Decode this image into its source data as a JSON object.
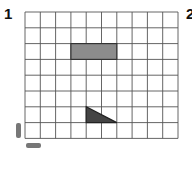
{
  "labels": {
    "figure1": "1",
    "figure2": "2"
  },
  "grid": {
    "columns": 10,
    "rows": 8,
    "left": 25,
    "top": 12,
    "cell_width": 15.3,
    "cell_height": 15.8,
    "line_color": "#555555",
    "background": "#ffffff"
  },
  "shapes": [
    {
      "type": "rectangle",
      "col": 3,
      "row": 2,
      "width_cells": 3,
      "height_cells": 1,
      "fill": "#8c8c8c",
      "stroke": "#333333"
    },
    {
      "type": "right-triangle",
      "col": 4,
      "row": 6,
      "width_cells": 2,
      "height_cells": 1,
      "right_angle": "bottom-left",
      "fill": "#444444",
      "stroke": "#222222"
    }
  ],
  "marks": [
    {
      "type": "vertical-smudge",
      "color": "#777777"
    },
    {
      "type": "horizontal-smudge",
      "color": "#777777"
    }
  ]
}
